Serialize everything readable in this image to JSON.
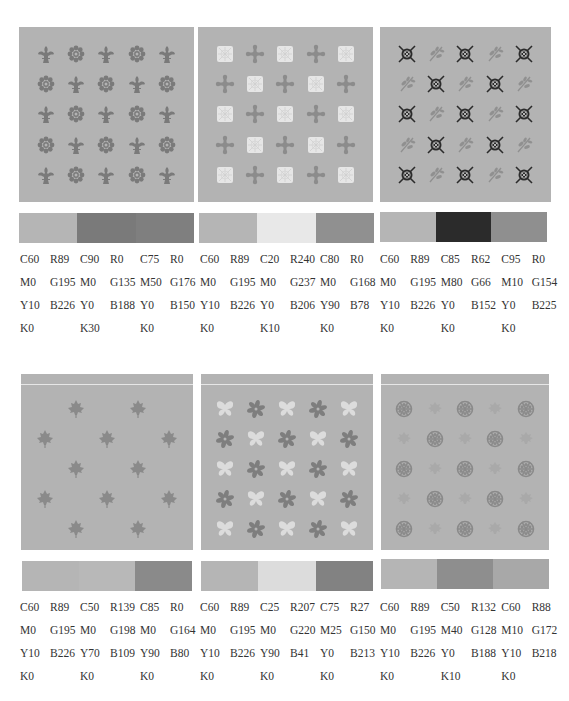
{
  "panels": [
    {
      "id": "fleur-flower",
      "motifs": [
        "fleur-de-lis",
        "daisy-flower"
      ],
      "bg": "#b3b3b3",
      "colors": [
        "#b5b5b5",
        "#7a7a7a",
        "#7f7f7f"
      ],
      "swatches": [
        {
          "cmyk": {
            "c": "C60",
            "m": "M0",
            "y": "Y10",
            "k": "K0"
          },
          "rgb": {
            "r": "R89",
            "g": "G195",
            "b": "B226"
          }
        },
        {
          "cmyk": {
            "c": "C90",
            "m": "M0",
            "y": "Y0",
            "k": "K30"
          },
          "rgb": {
            "r": "R0",
            "g": "G135",
            "b": "B188"
          }
        },
        {
          "cmyk": {
            "c": "C75",
            "m": "M50",
            "y": "Y0",
            "k": "K0"
          },
          "rgb": {
            "r": "R0",
            "g": "G176",
            "b": "B150"
          }
        }
      ]
    },
    {
      "id": "lace-cross",
      "motifs": [
        "lace-square",
        "cross-quatrefoil"
      ],
      "colors": [
        "#b5b5b5",
        "#e8e8e8",
        "#909090"
      ],
      "swatches": [
        {
          "cmyk": {
            "c": "C60",
            "m": "M0",
            "y": "Y10",
            "k": "K0"
          },
          "rgb": {
            "r": "R89",
            "g": "G195",
            "b": "B226"
          }
        },
        {
          "cmyk": {
            "c": "C20",
            "m": "M0",
            "y": "Y0",
            "k": "K10"
          },
          "rgb": {
            "r": "R240",
            "g": "G237",
            "b": "B206"
          }
        },
        {
          "cmyk": {
            "c": "C80",
            "m": "M0",
            "y": "Y90",
            "k": "K0"
          },
          "rgb": {
            "r": "R0",
            "g": "G168",
            "b": "B78"
          }
        }
      ]
    },
    {
      "id": "knot-sprig",
      "motifs": [
        "celtic-knot",
        "leaf-sprig"
      ],
      "colors": [
        "#b5b5b5",
        "#2b2b2b",
        "#8f8f8f"
      ],
      "swatches": [
        {
          "cmyk": {
            "c": "C60",
            "m": "M0",
            "y": "Y10",
            "k": "K0"
          },
          "rgb": {
            "r": "R89",
            "g": "G195",
            "b": "B226"
          }
        },
        {
          "cmyk": {
            "c": "C85",
            "m": "M80",
            "y": "Y0",
            "k": "K0"
          },
          "rgb": {
            "r": "R62",
            "g": "G66",
            "b": "B152"
          }
        },
        {
          "cmyk": {
            "c": "C95",
            "m": "M10",
            "y": "Y0",
            "k": "K0"
          },
          "rgb": {
            "r": "R0",
            "g": "G154",
            "b": "B225"
          }
        }
      ]
    },
    {
      "id": "maple",
      "motifs": [
        "maple-leaf"
      ],
      "colors": [
        "#b5b5b5",
        "#b8b8b8",
        "#8a8a8a"
      ],
      "swatches": [
        {
          "cmyk": {
            "c": "C60",
            "m": "M0",
            "y": "Y10",
            "k": "K0"
          },
          "rgb": {
            "r": "R89",
            "g": "G195",
            "b": "B226"
          }
        },
        {
          "cmyk": {
            "c": "C50",
            "m": "M0",
            "y": "Y70",
            "k": "K0"
          },
          "rgb": {
            "r": "R139",
            "g": "G198",
            "b": "B109"
          }
        },
        {
          "cmyk": {
            "c": "C85",
            "m": "M0",
            "y": "Y90",
            "k": "K0"
          },
          "rgb": {
            "r": "R0",
            "g": "G164",
            "b": "B80"
          }
        }
      ]
    },
    {
      "id": "butterfly-star",
      "motifs": [
        "butterfly",
        "star-flower"
      ],
      "colors": [
        "#b5b5b5",
        "#dcdcdc",
        "#828282"
      ],
      "swatches": [
        {
          "cmyk": {
            "c": "C60",
            "m": "M0",
            "y": "Y10",
            "k": "K0"
          },
          "rgb": {
            "r": "R89",
            "g": "G195",
            "b": "B226"
          }
        },
        {
          "cmyk": {
            "c": "C25",
            "m": "M0",
            "y": "Y90",
            "k": "K0"
          },
          "rgb": {
            "r": "R207",
            "g": "G220",
            "b": "B41"
          }
        },
        {
          "cmyk": {
            "c": "C75",
            "m": "M25",
            "y": "Y0",
            "k": "K0"
          },
          "rgb": {
            "r": "R27",
            "g": "G150",
            "b": "B213"
          }
        }
      ]
    },
    {
      "id": "snowflake-leaf",
      "motifs": [
        "snowflake",
        "maple-leaf-faint"
      ],
      "colors": [
        "#b5b5b5",
        "#8e8e8e",
        "#a8a8a8"
      ],
      "swatches": [
        {
          "cmyk": {
            "c": "C60",
            "m": "M0",
            "y": "Y10",
            "k": "K0"
          },
          "rgb": {
            "r": "R89",
            "g": "G195",
            "b": "B226"
          }
        },
        {
          "cmyk": {
            "c": "C50",
            "m": "M40",
            "y": "Y0",
            "k": "K10"
          },
          "rgb": {
            "r": "R132",
            "g": "G128",
            "b": "B188"
          }
        },
        {
          "cmyk": {
            "c": "C60",
            "m": "M10",
            "y": "Y10",
            "k": "K0"
          },
          "rgb": {
            "r": "R88",
            "g": "G172",
            "b": "B218"
          }
        }
      ]
    }
  ]
}
